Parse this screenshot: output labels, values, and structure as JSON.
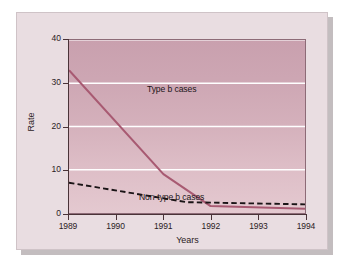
{
  "figure": {
    "background_color": "#e9dde1",
    "plot_background_top": "#c9a0ae",
    "plot_background_bottom": "#e4c9d0"
  },
  "chart_data": {
    "type": "line",
    "title": "",
    "subtitle": "",
    "xlabel": "Years",
    "ylabel": "Rate",
    "x": [
      1989,
      1990,
      1991,
      1992,
      1993,
      1994
    ],
    "xtick_labels": [
      "1989",
      "1990",
      "1991",
      "1992",
      "1993",
      "1994"
    ],
    "ytick_labels": [
      "0",
      "10",
      "20",
      "30",
      "40"
    ],
    "ytick_values": [
      0,
      10,
      20,
      30,
      40
    ],
    "xlim": [
      1989,
      1994
    ],
    "ylim": [
      0,
      40
    ],
    "grid": "horizontal-white",
    "legend_position": "inline-annotations",
    "series": [
      {
        "name": "Type b cases",
        "style": "solid",
        "color": "#a85a72",
        "x": [
          1989,
          1991,
          1992,
          1994
        ],
        "values": [
          33,
          9,
          1.6,
          1.0
        ]
      },
      {
        "name": "Non-type b cases",
        "style": "dashed",
        "color": "#1a1416",
        "x": [
          1989,
          1991.5,
          1994
        ],
        "values": [
          7,
          2.5,
          2.0
        ]
      }
    ],
    "annotations": [
      {
        "text": "Type b cases",
        "x": 1989.6,
        "y": 35
      },
      {
        "text": "Non-type b cases",
        "x": 1989.1,
        "y": 10.5
      }
    ]
  }
}
